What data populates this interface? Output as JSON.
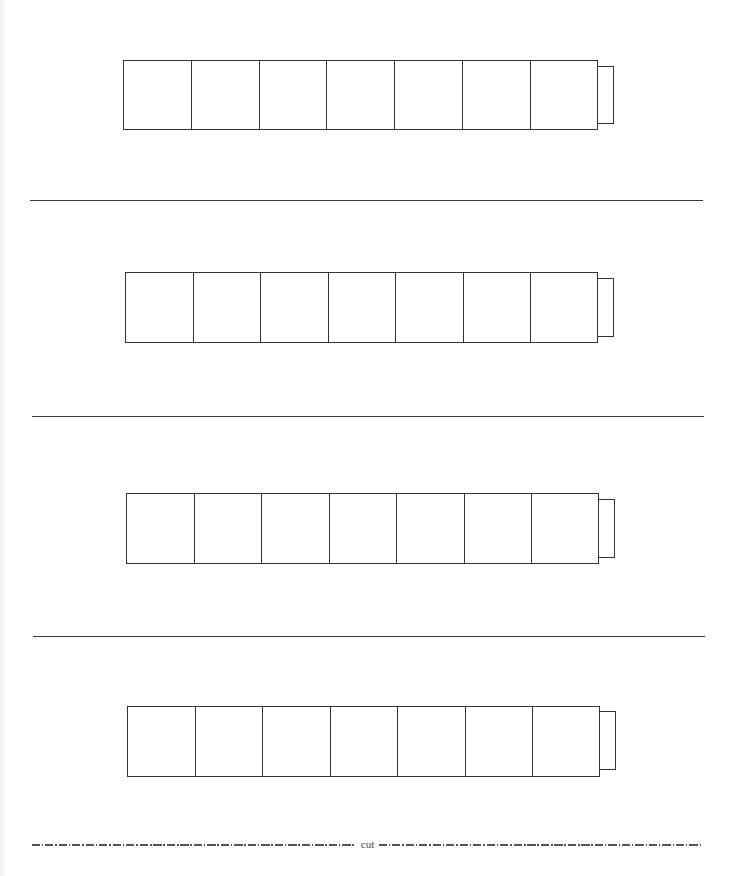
{
  "document": {
    "type": "printable-worksheet",
    "colors": {
      "line": "#333333",
      "background": "#ffffff"
    },
    "strips": [
      {
        "id": 1,
        "cells": 7,
        "has_end_tab": true,
        "left": 123,
        "top": 60,
        "width": 474,
        "height": 70,
        "tab_width": 15,
        "tab_inset": 6
      },
      {
        "id": 2,
        "cells": 7,
        "has_end_tab": true,
        "left": 125,
        "top": 272,
        "width": 472,
        "height": 71,
        "tab_width": 16,
        "tab_inset": 6
      },
      {
        "id": 3,
        "cells": 7,
        "has_end_tab": true,
        "left": 126,
        "top": 493,
        "width": 472,
        "height": 71,
        "tab_width": 16,
        "tab_inset": 6
      },
      {
        "id": 4,
        "cells": 7,
        "has_end_tab": true,
        "left": 127,
        "top": 706,
        "width": 472,
        "height": 71,
        "tab_width": 16,
        "tab_inset": 6
      }
    ],
    "separators": [
      {
        "left": 30,
        "top": 200,
        "width": 673
      },
      {
        "left": 32,
        "top": 416,
        "width": 672
      },
      {
        "left": 33,
        "top": 636,
        "width": 672
      }
    ],
    "cut_line": {
      "label": "cut",
      "left": 32,
      "top": 838,
      "width": 671,
      "style": "dash-dot"
    }
  }
}
